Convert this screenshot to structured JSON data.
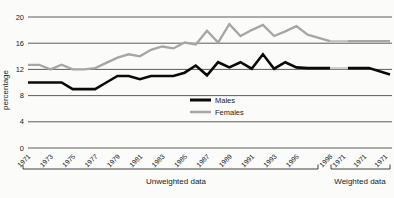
{
  "figure": {
    "background": "#fbfbfa"
  },
  "chart_data": {
    "type": "line",
    "title": "",
    "xlabel": "",
    "ylabel": "percentage",
    "ylim": [
      0,
      20
    ],
    "yticks": [
      0,
      4,
      8,
      12,
      16,
      20
    ],
    "grid": "horizontal",
    "colors": {
      "males": "#0a0a0a",
      "females": "#a6a6a6",
      "gridline": "#4a4a4a",
      "bracket": "#2a2a2a",
      "text": "#1a1a1a",
      "bridge_males": "#cfcfcf",
      "bridge_females": "#c2c2c2"
    },
    "unweighted": {
      "group_label": "Unweighted data",
      "years": [
        1971,
        1972,
        1973,
        1974,
        1975,
        1976,
        1977,
        1978,
        1979,
        1980,
        1981,
        1982,
        1983,
        1984,
        1985,
        1986,
        1987,
        1988,
        1989,
        1990,
        1991,
        1992,
        1993,
        1994,
        1995,
        1996,
        1998
      ],
      "xtick_years": [
        1971,
        1973,
        1975,
        1977,
        1979,
        1981,
        1983,
        1985,
        1987,
        1989,
        1991,
        1993,
        1995,
        1998
      ],
      "series": [
        {
          "name": "Females",
          "color_key": "females",
          "values": [
            12.7,
            12.7,
            12.0,
            12.7,
            12.0,
            12.0,
            12.2,
            13.0,
            13.8,
            14.3,
            14.0,
            15.0,
            15.5,
            15.2,
            16.1,
            15.8,
            17.9,
            16.1,
            18.9,
            17.1,
            18.0,
            18.8,
            17.1,
            17.8,
            18.6,
            17.3,
            16.3
          ]
        },
        {
          "name": "Males",
          "color_key": "males",
          "values": [
            10.0,
            10.0,
            10.0,
            10.0,
            9.0,
            9.0,
            9.0,
            10.0,
            11.0,
            11.0,
            10.5,
            11.0,
            11.0,
            11.0,
            11.5,
            12.6,
            11.1,
            13.1,
            12.3,
            13.1,
            12.1,
            14.3,
            12.1,
            13.1,
            12.3,
            12.2,
            12.2
          ]
        }
      ]
    },
    "weighted": {
      "group_label": "Weighted data",
      "xtick_labels": [
        "1971",
        "1971",
        "1971"
      ],
      "series": [
        {
          "name": "Females",
          "color_key": "females",
          "values": [
            16.3,
            16.3,
            16.3
          ]
        },
        {
          "name": "Males",
          "color_key": "males",
          "values": [
            12.2,
            12.2,
            11.2
          ]
        }
      ]
    },
    "legend": {
      "position": "inside-bottom-center",
      "entries": [
        {
          "label": "Males",
          "color_key": "males"
        },
        {
          "label": "Females",
          "color_key": "females"
        }
      ]
    }
  }
}
